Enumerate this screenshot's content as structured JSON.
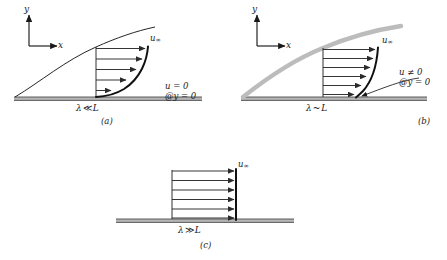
{
  "figure": {
    "axis": {
      "y_label": "y",
      "x_label": "x"
    },
    "colors": {
      "ink": "#1a1a1a",
      "plate": "#a8a8a8",
      "plate_line": "#5a5a5a",
      "boundary_thin": "#111111",
      "boundary_thick_gray": "#b9b9b9",
      "arrow": "#2b2b2b",
      "background": "#ffffff"
    }
  },
  "panels": [
    {
      "id": "a",
      "caption": "(a)",
      "regime_label": {
        "lambda": "λ",
        "operator": "≪",
        "length": "L"
      },
      "regime_text": "λ ≪ L",
      "freestream_label": "u",
      "freestream_sub": "∞",
      "wall_condition": [
        "u = 0",
        "@y = 0"
      ],
      "profile_type": "no-slip-boundary-layer",
      "wall_velocity": 0,
      "arrow_count": 5,
      "boundary_layer_style": "thin-black-curve",
      "has_annotation_arrow": false
    },
    {
      "id": "b",
      "caption": "(b)",
      "regime_label": {
        "lambda": "λ",
        "operator": "~",
        "length": "L"
      },
      "regime_text": "λ ~ L",
      "freestream_label": "u",
      "freestream_sub": "∞",
      "wall_condition": [
        "u ≠ 0",
        "@y = 0"
      ],
      "profile_type": "slip-boundary-layer",
      "wall_velocity": 0.22,
      "arrow_count": 6,
      "boundary_layer_style": "thick-gray-curve",
      "has_annotation_arrow": true
    },
    {
      "id": "c",
      "caption": "(c)",
      "regime_label": {
        "lambda": "λ",
        "operator": "≫",
        "length": "L"
      },
      "regime_text": "λ ≫ L",
      "freestream_label": "u",
      "freestream_sub": "∞",
      "wall_condition": [],
      "profile_type": "uniform-plug-flow",
      "wall_velocity": 1.0,
      "arrow_count": 6,
      "boundary_layer_style": "none",
      "has_annotation_arrow": false
    }
  ]
}
